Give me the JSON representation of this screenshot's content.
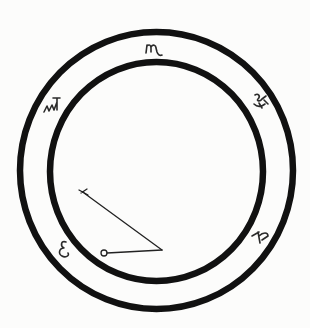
{
  "diagram": {
    "title": "",
    "colors": {
      "ink": "#111111",
      "background": "#fcfcfb"
    },
    "outer_ring": {
      "cx": 156.5,
      "cy": 170.5,
      "rx": 136.5,
      "ry": 138.5,
      "stroke_width": 6.5
    },
    "inner_ring": {
      "cx": 156.5,
      "cy": 171.5,
      "rx": 106.5,
      "ry": 109.5,
      "stroke_width": 6.5
    },
    "glyphs": [
      {
        "id": "top",
        "position": "12 o'clock",
        "x": 153,
        "y": 49,
        "label": "ɯ"
      },
      {
        "id": "upper-left",
        "position": "10 o'clock",
        "x": 52,
        "y": 107,
        "label": "ʎ"
      },
      {
        "id": "upper-right",
        "position": "2 o'clock",
        "x": 260,
        "y": 104,
        "label": "ⴽ"
      },
      {
        "id": "lower-left",
        "position": "8 o'clock",
        "x": 65,
        "y": 249,
        "label": "ɛ"
      },
      {
        "id": "lower-right",
        "position": "4 o'clock",
        "x": 262,
        "y": 237,
        "label": "ʞ"
      }
    ],
    "pointer": {
      "long_segment": {
        "from": [
          83,
          193
        ],
        "to": [
          162,
          250
        ],
        "start_cap": "T-bar"
      },
      "short_segment": {
        "from": [
          162,
          250
        ],
        "to": [
          103,
          253
        ],
        "end_cap": "small circle"
      }
    }
  }
}
